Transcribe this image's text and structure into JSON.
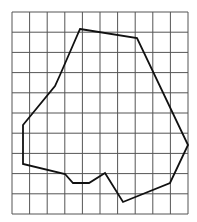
{
  "figure": {
    "type": "grid-with-polygon",
    "grid": {
      "columns": 10,
      "rows": 10,
      "x0": 12,
      "y0": 12,
      "x1": 188,
      "y1": 214,
      "line_color": "#555555",
      "line_width": 1
    },
    "polygon": {
      "stroke": "#111111",
      "stroke_width": 1.8,
      "fill": "none",
      "points": [
        [
          80,
          29
        ],
        [
          137,
          38
        ],
        [
          188,
          145
        ],
        [
          170,
          183
        ],
        [
          123,
          202
        ],
        [
          105,
          173
        ],
        [
          89,
          183
        ],
        [
          73,
          183
        ],
        [
          65,
          174
        ],
        [
          23,
          164
        ],
        [
          23,
          125
        ],
        [
          55,
          86
        ],
        [
          60,
          75
        ]
      ]
    }
  }
}
